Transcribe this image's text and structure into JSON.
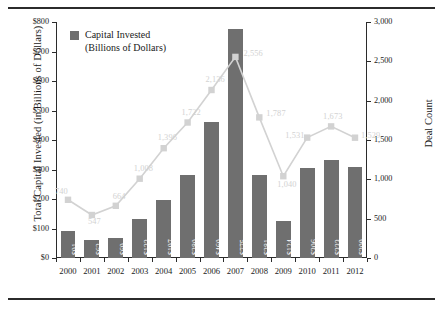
{
  "chart_data": {
    "type": "bar",
    "title": "",
    "subtitle": "",
    "xlabel": "",
    "ylabel": "Total Capital Invested (in Billions of Dollars)",
    "y2label": "Deal Count",
    "grid": false,
    "legend_position": "top-left",
    "categories": [
      "2000",
      "2001",
      "2002",
      "2003",
      "2004",
      "2005",
      "2006",
      "2007",
      "2008",
      "2009",
      "2010",
      "2011",
      "2012"
    ],
    "ylim": [
      0,
      800
    ],
    "y2lim": [
      0,
      3000
    ],
    "yticks": [
      "$0",
      "$100",
      "$200",
      "$300",
      "$400",
      "$500",
      "$600",
      "$700",
      "$800"
    ],
    "ytick_values": [
      0,
      100,
      200,
      300,
      400,
      500,
      600,
      700,
      800
    ],
    "y2ticks": [
      "0",
      "500",
      "1,000",
      "1,500",
      "2,000",
      "2,500",
      "3,000"
    ],
    "y2tick_values": [
      0,
      500,
      1000,
      1500,
      2000,
      2500,
      3000
    ],
    "series": [
      {
        "name": "Capital Invested (Billions of Dollars)",
        "type": "bar",
        "axis": "left",
        "color": "#6f6f6f",
        "values": [
          91,
          62,
          69,
          133,
          197,
          280,
          460,
          775,
          281,
          124,
          306,
          333,
          309
        ],
        "labels": [
          "$91",
          "$62",
          "$69",
          "$133",
          "$197",
          "$280",
          "$460",
          "$775",
          "$281",
          "$124",
          "$306",
          "$333",
          "$309"
        ]
      },
      {
        "name": "Deal Count",
        "type": "line",
        "axis": "right",
        "color": "#d2d2d2",
        "values": [
          740,
          547,
          664,
          1008,
          1396,
          1722,
          2136,
          2556,
          1787,
          1040,
          1531,
          1673,
          1529
        ],
        "labels": [
          "740",
          "547",
          "664",
          "1,008",
          "1,396",
          "1,722",
          "2,136",
          "2,556",
          "1,787",
          "1,040",
          "1,531",
          "1,673",
          "1,529"
        ]
      }
    ]
  },
  "legend": {
    "entries": [
      {
        "label": "Capital Invested\n(Billions of Dollars)",
        "color": "#6f6f6f"
      }
    ]
  }
}
